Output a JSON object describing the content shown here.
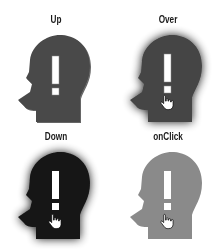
{
  "states": [
    {
      "id": "up",
      "label": "Up",
      "fill": "#4a4a4a",
      "glow": false,
      "cursor": false
    },
    {
      "id": "over",
      "label": "Over",
      "fill": "#454545",
      "glow": true,
      "cursor": true
    },
    {
      "id": "down",
      "label": "Down",
      "fill": "#141414",
      "glow": true,
      "cursor": true
    },
    {
      "id": "onclick",
      "label": "onClick",
      "fill": "#8a8a8a",
      "glow": false,
      "cursor": true
    }
  ],
  "icons": {
    "symbol": "!",
    "cursor": "hand-pointer"
  }
}
